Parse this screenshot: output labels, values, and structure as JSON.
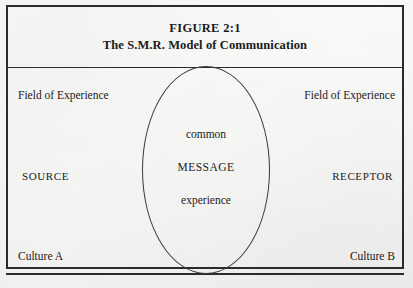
{
  "figure": {
    "title_line_1": "FIGURE 2:1",
    "title_line_2": "The S.M.R. Model of Communication"
  },
  "diagram": {
    "type": "venn",
    "left_region": {
      "field_label": "Field of Experience",
      "actor_label": "SOURCE",
      "culture_label": "Culture A"
    },
    "right_region": {
      "field_label": "Field of Experience",
      "actor_label": "RECEPTOR",
      "culture_label": "Culture B"
    },
    "overlap_region": {
      "lines": [
        "common",
        "MESSAGE",
        "experience"
      ]
    }
  },
  "colors": {
    "ink": "#2b2b2b",
    "line": "#3a3a3a",
    "paper": "#fbfbfa"
  }
}
